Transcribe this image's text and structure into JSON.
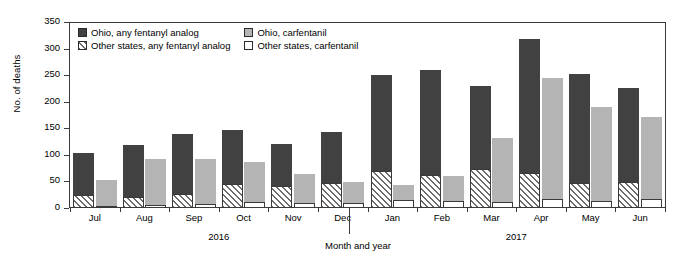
{
  "chart_data": {
    "type": "bar",
    "title": "",
    "xlabel": "Month and year",
    "ylabel": "No. of deaths",
    "ylim": [
      0,
      350
    ],
    "yticks": [
      0,
      50,
      100,
      150,
      200,
      250,
      300,
      350
    ],
    "grid": false,
    "legend_position": "top-left inside plot",
    "categories": [
      "Jul",
      "Aug",
      "Sep",
      "Oct",
      "Nov",
      "Dec",
      "Jan",
      "Feb",
      "Mar",
      "Apr",
      "May",
      "Jun"
    ],
    "period_groups": [
      {
        "label": "2016",
        "months": [
          "Jul",
          "Aug",
          "Sep",
          "Oct",
          "Nov",
          "Dec"
        ]
      },
      {
        "label": "2017",
        "months": [
          "Jan",
          "Feb",
          "Mar",
          "Apr",
          "May",
          "Jun"
        ]
      }
    ],
    "bar_pairs": [
      {
        "name": "any fentanyl analog",
        "stack": [
          "Other states, any fentanyl analog",
          "Ohio, any fentanyl analog"
        ]
      },
      {
        "name": "carfentanil",
        "stack": [
          "Other states, carfentanil",
          "Ohio, carfentanil"
        ]
      }
    ],
    "series": [
      {
        "name": "Ohio, any fentanyl analog",
        "fill": "solid-dark",
        "color": "#414141",
        "values": [
          79,
          97,
          114,
          100,
          80,
          96,
          180,
          197,
          155,
          253,
          205,
          176
        ]
      },
      {
        "name": "Other states, any fentanyl analog",
        "fill": "diagonal-hatch",
        "color": "#ffffff",
        "values": [
          25,
          21,
          26,
          46,
          41,
          47,
          70,
          62,
          74,
          65,
          48,
          49
        ]
      },
      {
        "name": "Ohio, carfentanil",
        "fill": "solid-gray",
        "color": "#b4b4b4",
        "values": [
          51,
          88,
          86,
          75,
          55,
          40,
          28,
          47,
          119,
          228,
          178,
          155
        ]
      },
      {
        "name": "Other states, carfentanil",
        "fill": "open-white",
        "color": "#ffffff",
        "values": [
          2,
          5,
          7,
          11,
          9,
          9,
          15,
          13,
          12,
          17,
          13,
          17
        ]
      }
    ],
    "totals": {
      "any_fentanyl_analog": [
        104,
        118,
        140,
        146,
        121,
        143,
        250,
        259,
        229,
        318,
        253,
        225
      ],
      "carfentanil": [
        53,
        93,
        93,
        86,
        64,
        49,
        43,
        60,
        131,
        245,
        191,
        172
      ]
    }
  },
  "legend": {
    "items": [
      {
        "label": "Ohio, any fentanyl analog",
        "swatch": "solid-dark-swatch"
      },
      {
        "label": "Ohio, carfentanil",
        "swatch": "solid-gray-swatch"
      },
      {
        "label": "Other states, any fentanyl analog",
        "swatch": "hatched-swatch"
      },
      {
        "label": "Other states, carfentanil",
        "swatch": "open-white-swatch"
      }
    ]
  },
  "colors": {
    "ohio_analog": "#414141",
    "ohio_carfentanil": "#b4b4b4",
    "other_states": "#ffffff",
    "axis": "#3a3a3a"
  }
}
